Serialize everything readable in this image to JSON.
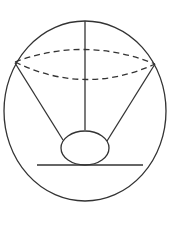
{
  "diagram": {
    "title": "",
    "stroke_color": "#333333",
    "background": "#ffffff",
    "outer_sphere": {
      "cx": 85,
      "cy": 111,
      "rx": 81,
      "ry": 90
    },
    "cone_base_ellipse": {
      "cx": 85,
      "cy": 64,
      "rx": 70,
      "ry": 18,
      "dashed": true
    },
    "cone_base_left": {
      "x": 15,
      "y": 62
    },
    "cone_base_right": {
      "x": 155,
      "y": 64
    },
    "cone_axis": {
      "x1": 85,
      "y1": 21,
      "x2": 85,
      "y2": 130
    },
    "cone_side_left": {
      "x1": 15,
      "y1": 63,
      "x2": 63,
      "y2": 140
    },
    "cone_side_right": {
      "x1": 155,
      "y1": 64,
      "x2": 107,
      "y2": 141
    },
    "inner_sphere": {
      "cx": 85,
      "cy": 148,
      "rx": 24,
      "ry": 17
    },
    "tangent_line": {
      "x1": 37,
      "y1": 165,
      "x2": 143,
      "y2": 165
    }
  }
}
